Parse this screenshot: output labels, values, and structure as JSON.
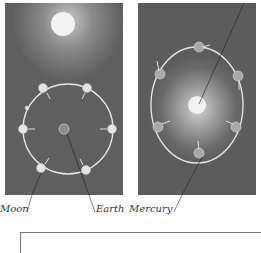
{
  "figure": {
    "panels": [
      {
        "id": "earth-moon",
        "description": "Moon orbiting Earth with Sun above; Moon shown at 8 positions"
      },
      {
        "id": "mercury-sun",
        "description": "Mercury orbiting the Sun in an elliptical orbit; Mercury shown at 7 positions"
      }
    ],
    "labels": {
      "moon": "Moon",
      "earth": "Earth",
      "mercury": "Mercury"
    },
    "colors": {
      "panel_bg": "#5e5e5e",
      "orbit": "#e8e8e8",
      "sun": "#f2f2f2",
      "leader_line": "#222222"
    }
  }
}
